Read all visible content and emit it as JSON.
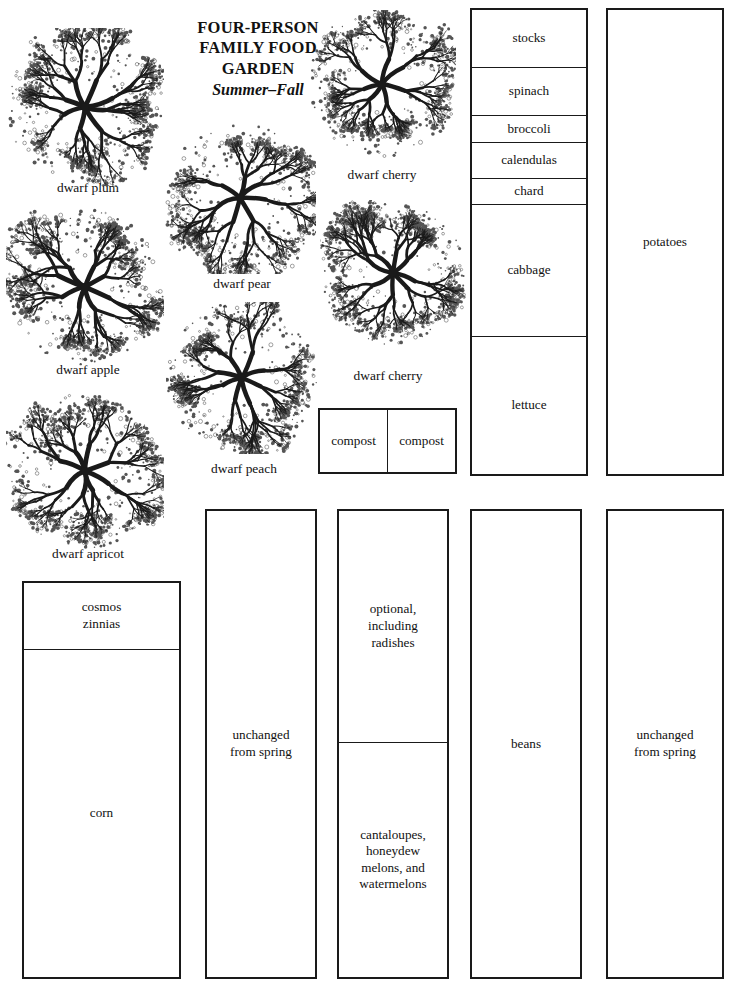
{
  "title": {
    "line1": "FOUR-PERSON",
    "line2": "FAMILY FOOD",
    "line3": "GARDEN",
    "season": "Summer–Fall"
  },
  "trees": [
    {
      "label": "dwarf plum",
      "x": 6,
      "y": 28,
      "size": 158,
      "label_x": 14,
      "label_y": 180,
      "label_w": 148,
      "seed": 11
    },
    {
      "label": "dwarf apple",
      "x": 6,
      "y": 208,
      "size": 158,
      "label_x": 14,
      "label_y": 362,
      "label_w": 148,
      "seed": 23
    },
    {
      "label": "dwarf apricot",
      "x": 6,
      "y": 392,
      "size": 158,
      "label_x": 14,
      "label_y": 546,
      "label_w": 148,
      "seed": 37
    },
    {
      "label": "dwarf pear",
      "x": 164,
      "y": 122,
      "size": 152,
      "label_x": 168,
      "label_y": 276,
      "label_w": 148,
      "seed": 51
    },
    {
      "label": "dwarf peach",
      "x": 166,
      "y": 302,
      "size": 152,
      "label_x": 170,
      "label_y": 461,
      "label_w": 148,
      "seed": 67
    },
    {
      "label": "dwarf cherry",
      "x": 308,
      "y": 10,
      "size": 148,
      "label_x": 308,
      "label_y": 167,
      "label_w": 148,
      "seed": 83
    },
    {
      "label": "dwarf cherry",
      "x": 320,
      "y": 200,
      "size": 146,
      "label_x": 314,
      "label_y": 368,
      "label_w": 148,
      "seed": 97
    }
  ],
  "beds": [
    {
      "name": "north-vegetable-bed",
      "x": 470,
      "y": 8,
      "w": 118,
      "h": 468,
      "orientation": "vertical",
      "cells": [
        {
          "label": "stocks",
          "flex": 58
        },
        {
          "label": "spinach",
          "flex": 48
        },
        {
          "label": "broccoli",
          "flex": 27
        },
        {
          "label": "calendulas",
          "flex": 36
        },
        {
          "label": "chard",
          "flex": 25
        },
        {
          "label": "cabbage",
          "flex": 134
        },
        {
          "label": "lettuce",
          "flex": 140
        }
      ]
    },
    {
      "name": "potatoes-bed",
      "x": 606,
      "y": 8,
      "w": 118,
      "h": 468,
      "orientation": "vertical",
      "cells": [
        {
          "label": "potatoes",
          "flex": 1
        }
      ]
    },
    {
      "name": "compost-bins",
      "x": 318,
      "y": 408,
      "w": 139,
      "h": 66,
      "orientation": "horizontal",
      "cells": [
        {
          "label": "compost",
          "flex": 1
        },
        {
          "label": "compost",
          "flex": 1
        }
      ]
    },
    {
      "name": "corn-bed",
      "x": 22,
      "y": 581,
      "w": 159,
      "h": 398,
      "orientation": "vertical",
      "cells": [
        {
          "label": "cosmos\nzinnias",
          "flex": 66
        },
        {
          "label": "corn",
          "flex": 330
        }
      ]
    },
    {
      "name": "unchanged-bed-west",
      "x": 205,
      "y": 509,
      "w": 112,
      "h": 470,
      "orientation": "vertical",
      "cells": [
        {
          "label": "unchanged\nfrom spring",
          "flex": 1
        }
      ]
    },
    {
      "name": "melon-bed",
      "x": 337,
      "y": 509,
      "w": 112,
      "h": 470,
      "orientation": "vertical",
      "cells": [
        {
          "label": "optional,\nincluding\nradishes",
          "flex": 232
        },
        {
          "label": "cantaloupes,\nhoneydew\nmelons, and\nwatermelons",
          "flex": 236
        }
      ]
    },
    {
      "name": "beans-bed",
      "x": 470,
      "y": 509,
      "w": 112,
      "h": 470,
      "orientation": "vertical",
      "cells": [
        {
          "label": "beans",
          "flex": 1
        }
      ]
    },
    {
      "name": "unchanged-bed-east",
      "x": 606,
      "y": 509,
      "w": 118,
      "h": 470,
      "orientation": "vertical",
      "cells": [
        {
          "label": "unchanged\nfrom spring",
          "flex": 1
        }
      ]
    }
  ],
  "colors": {
    "ink": "#1a1a1a",
    "paper": "#ffffff",
    "foliage": "#555555"
  }
}
